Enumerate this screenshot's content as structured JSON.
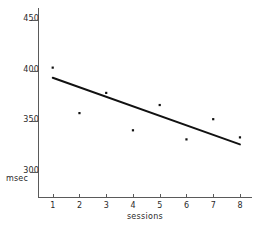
{
  "chart_data": {
    "type": "scatter",
    "title": "",
    "subtitle": "",
    "xlabel": "sessions",
    "ylabel": "msec",
    "x": [
      1,
      2,
      3,
      4,
      5,
      6,
      7,
      8
    ],
    "categories": [
      "1",
      "2",
      "3",
      "4",
      "5",
      "6",
      "7",
      "8"
    ],
    "values": [
      403,
      358,
      378,
      341,
      366,
      332,
      352,
      334
    ],
    "series": [
      {
        "name": "observed",
        "type": "scatter",
        "values": [
          403,
          358,
          378,
          341,
          366,
          332,
          352,
          334
        ]
      },
      {
        "name": "regression line",
        "type": "line",
        "x_endpoints": [
          1,
          8
        ],
        "y_endpoints": [
          393,
          327
        ]
      }
    ],
    "xlim": [
      0.45,
      8.45
    ],
    "ylim": [
      275,
      462
    ],
    "xticks": [
      1,
      2,
      3,
      4,
      5,
      6,
      7,
      8
    ],
    "xtick_labels": [
      "1",
      "2",
      "3",
      "4",
      "5",
      "6",
      "7",
      "8"
    ],
    "yticks": [
      300,
      350,
      400,
      450
    ],
    "ytick_labels": [
      "300",
      "350",
      "400",
      "450"
    ],
    "grid": false,
    "legend": false,
    "legend_position": "none",
    "annotations": [],
    "colors": {
      "axis": "#5a5a5a",
      "point": "#111111",
      "line": "#111111",
      "text": "#2a2a2a",
      "background": "#ffffff"
    }
  },
  "axes": {
    "y_title": "msec",
    "x_title": "sessions",
    "y_labels": [
      "450",
      "400",
      "350",
      "300"
    ],
    "x_labels": [
      "1",
      "2",
      "3",
      "4",
      "5",
      "6",
      "7",
      "8"
    ]
  }
}
